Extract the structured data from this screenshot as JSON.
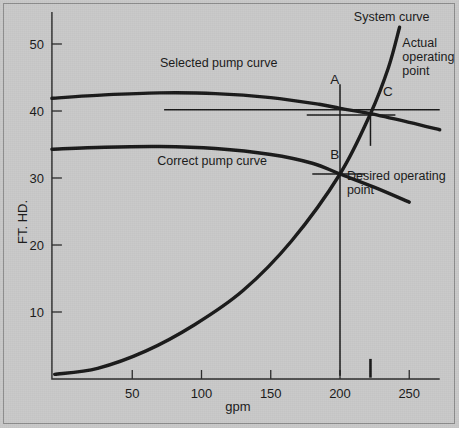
{
  "figure": {
    "background_color": "#c9c9c9",
    "ink_color": "#1a1a1a",
    "border_color": "#8d8d8d"
  },
  "chart_data": {
    "type": "line",
    "title": "",
    "xlabel": "gpm",
    "ylabel": "FT. HD.",
    "xlim": [
      -8,
      272
    ],
    "ylim": [
      0,
      55
    ],
    "grid": false,
    "legend": "none (inline curve annotations)",
    "xticks": [
      50,
      100,
      150,
      200,
      250
    ],
    "yticks": [
      10,
      20,
      30,
      40,
      50
    ],
    "series": [
      {
        "name": "Selected pump curve",
        "label_text": "Selected pump curve",
        "points": [
          {
            "x": -8,
            "y": 41.9
          },
          {
            "x": 30,
            "y": 42.4
          },
          {
            "x": 70,
            "y": 42.7
          },
          {
            "x": 110,
            "y": 42.6
          },
          {
            "x": 150,
            "y": 42.0
          },
          {
            "x": 185,
            "y": 41.0
          },
          {
            "x": 200,
            "y": 40.4
          },
          {
            "x": 222,
            "y": 39.6
          },
          {
            "x": 250,
            "y": 38.3
          },
          {
            "x": 272,
            "y": 37.2
          }
        ]
      },
      {
        "name": "Correct pump curve",
        "label_text": "Correct pump curve",
        "points": [
          {
            "x": -8,
            "y": 34.3
          },
          {
            "x": 30,
            "y": 34.6
          },
          {
            "x": 70,
            "y": 34.7
          },
          {
            "x": 110,
            "y": 34.4
          },
          {
            "x": 150,
            "y": 33.5
          },
          {
            "x": 180,
            "y": 32.2
          },
          {
            "x": 200,
            "y": 30.6
          },
          {
            "x": 225,
            "y": 28.6
          },
          {
            "x": 250,
            "y": 26.4
          }
        ]
      },
      {
        "name": "System curve",
        "label_text": "System curve",
        "points": [
          {
            "x": -6,
            "y": 0.7
          },
          {
            "x": 25,
            "y": 1.6
          },
          {
            "x": 60,
            "y": 4.2
          },
          {
            "x": 95,
            "y": 8.1
          },
          {
            "x": 130,
            "y": 13.2
          },
          {
            "x": 165,
            "y": 20.6
          },
          {
            "x": 200,
            "y": 30.6
          },
          {
            "x": 222,
            "y": 39.6
          },
          {
            "x": 235,
            "y": 46.5
          },
          {
            "x": 243,
            "y": 52.5
          }
        ]
      }
    ],
    "annotations": [
      {
        "name": "system-curve-label",
        "text": "System curve",
        "x": 210,
        "y": 53.5
      },
      {
        "name": "selected-pump-curve-label",
        "text": "Selected pump curve",
        "x": 70,
        "y": 46.5
      },
      {
        "name": "correct-pump-curve-label",
        "text": "Correct pump curve",
        "x": 68,
        "y": 31.9
      },
      {
        "name": "actual-operating-point-label",
        "text": "Actual\noperating\npoint",
        "x": 245,
        "y": 49.5
      },
      {
        "name": "desired-operating-point-label",
        "text": "Desired operating\npoint",
        "x": 205,
        "y": 29.7
      },
      {
        "name": "point-a-label",
        "text": "A",
        "x": 193,
        "y": 44.0
      },
      {
        "name": "point-b-label",
        "text": "B",
        "x": 193,
        "y": 32.8
      },
      {
        "name": "point-c-label",
        "text": "C",
        "x": 231,
        "y": 42.2
      }
    ],
    "markers": [
      {
        "name": "point-a",
        "label": "A",
        "x": 200,
        "y": 40.4,
        "note": "selected pump curve at desired flow"
      },
      {
        "name": "point-b",
        "label": "B",
        "x": 200,
        "y": 30.6,
        "note": "desired operating point"
      },
      {
        "name": "point-c",
        "label": "C",
        "x": 222,
        "y": 39.6,
        "note": "actual operating point"
      }
    ],
    "reference_lines": [
      {
        "name": "head-40-leader",
        "type": "horizontal",
        "y": 40.2,
        "x_from": 73,
        "x_to": 272
      },
      {
        "name": "head-39-leader",
        "type": "horizontal",
        "y": 39.4,
        "x_from": 176,
        "x_to": 240
      },
      {
        "name": "head-30-leader",
        "type": "horizontal",
        "y": 30.6,
        "x_from": 180,
        "x_to": 218
      },
      {
        "name": "flow-200-dropline",
        "type": "vertical",
        "x": 200,
        "y_from": 0.5,
        "y_to": 44.0
      },
      {
        "name": "flow-222-dropline-upper",
        "type": "vertical",
        "x": 222,
        "y_from": 34.8,
        "y_to": 39.6
      },
      {
        "name": "flow-222-tickmark",
        "type": "vertical",
        "x": 222,
        "y_from": 0.2,
        "y_to": 3.0
      }
    ]
  }
}
